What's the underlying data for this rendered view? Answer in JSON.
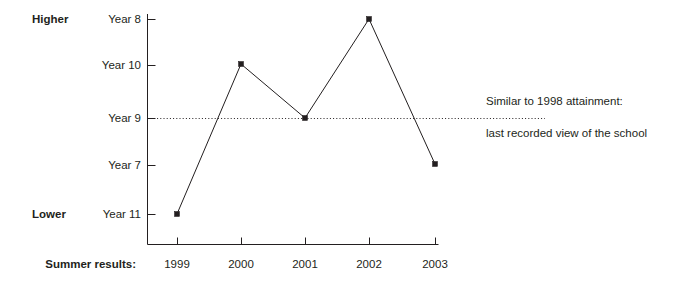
{
  "chart_data": {
    "type": "line",
    "title": "",
    "subtitle": "",
    "xlabel": "Summer results:",
    "ylabel": "",
    "grid": false,
    "legend": "none",
    "categories": [
      "1999",
      "2000",
      "2001",
      "2002",
      "2003"
    ],
    "x": [
      "1999",
      "2000",
      "2001",
      "2002",
      "2003"
    ],
    "y_tick_labels": [
      "Year 8",
      "Year 10",
      "Year 9",
      "Year 7",
      "Year 11"
    ],
    "y_axis_scale_note": "Ordinal rank scale, top = Higher, bottom = Lower",
    "y_axis_top_label": "Higher",
    "y_axis_bottom_label": "Lower",
    "ylim": [
      0,
      4
    ],
    "series": [
      {
        "name": "School performance rank",
        "values": [
          "Year 11",
          "Year 10",
          "Year 9",
          "Year 8",
          "Year 7"
        ],
        "rank_values": [
          0,
          3,
          2,
          4,
          1
        ]
      }
    ],
    "reference_line": {
      "at_y_label": "Year 9",
      "rank_value": 2,
      "style": "dotted",
      "annotation_line_1": "Similar to 1998 attainment:",
      "annotation_line_2": "last recorded view of the school"
    },
    "annotations": [
      "Similar to 1998 attainment:",
      "last recorded view of the school"
    ]
  },
  "axis": {
    "y_labels": [
      {
        "text": "Year 8",
        "y": 19
      },
      {
        "text": "Year 10",
        "y": 65
      },
      {
        "text": "Year 9",
        "y": 118
      },
      {
        "text": "Year 7",
        "y": 165
      },
      {
        "text": "Year 11",
        "y": 214
      }
    ],
    "x_labels": [
      {
        "text": "1999",
        "x": 177
      },
      {
        "text": "2000",
        "x": 241
      },
      {
        "text": "2001",
        "x": 305
      },
      {
        "text": "2002",
        "x": 369
      },
      {
        "text": "2003",
        "x": 435
      }
    ],
    "higher_label": "Higher",
    "lower_label": "Lower",
    "x_axis_title": "Summer results:"
  },
  "points": [
    {
      "label": "1999",
      "x": 177,
      "y": 214,
      "value": "Year 11"
    },
    {
      "label": "2000",
      "x": 241,
      "y": 64,
      "value": "Year 10"
    },
    {
      "label": "2001",
      "x": 305,
      "y": 118,
      "value": "Year 9"
    },
    {
      "label": "2002",
      "x": 369,
      "y": 19,
      "value": "Year 8"
    },
    {
      "label": "2003",
      "x": 435,
      "y": 164,
      "value": "Year 7"
    }
  ],
  "annotation": {
    "line1": "Similar to 1998 attainment:",
    "line2": "last recorded view of the school"
  },
  "colors": {
    "ink": "#231f20",
    "background": "#ffffff"
  }
}
